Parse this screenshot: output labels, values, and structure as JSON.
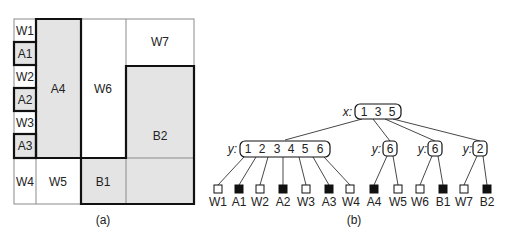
{
  "panel_a": {
    "caption": "(a)",
    "colors": {
      "shaded": "#e4e4e4",
      "white": "#ffffff",
      "thin_line": "#888888",
      "thick_line": "#111111"
    },
    "cells": [
      {
        "id": "W1",
        "label": "W1",
        "shaded": false
      },
      {
        "id": "A1",
        "label": "A1",
        "shaded": true
      },
      {
        "id": "W2",
        "label": "W2",
        "shaded": false
      },
      {
        "id": "A2",
        "label": "A2",
        "shaded": true
      },
      {
        "id": "W3",
        "label": "W3",
        "shaded": false
      },
      {
        "id": "A3",
        "label": "A3",
        "shaded": true
      },
      {
        "id": "A4",
        "label": "A4",
        "shaded": true
      },
      {
        "id": "W6",
        "label": "W6",
        "shaded": false
      },
      {
        "id": "W7",
        "label": "W7",
        "shaded": false
      },
      {
        "id": "B2",
        "label": "B2",
        "shaded": true
      },
      {
        "id": "W4",
        "label": "W4",
        "shaded": false
      },
      {
        "id": "W5",
        "label": "W5",
        "shaded": false
      },
      {
        "id": "B1",
        "label": "B1",
        "shaded": true
      }
    ]
  },
  "panel_b": {
    "caption": "(b)",
    "root": {
      "axis_label": "x:",
      "keys": [
        "1",
        "3",
        "5"
      ]
    },
    "internal_nodes": [
      {
        "axis_label": "y:",
        "keys": [
          "1",
          "2",
          "3",
          "4",
          "5",
          "6"
        ]
      },
      {
        "axis_label": "y:",
        "keys": [
          "6"
        ]
      },
      {
        "axis_label": "y:",
        "keys": [
          "6"
        ]
      },
      {
        "axis_label": "y:",
        "keys": [
          "2"
        ]
      }
    ],
    "leaves": [
      {
        "label": "W1",
        "filled": false
      },
      {
        "label": "A1",
        "filled": true
      },
      {
        "label": "W2",
        "filled": false
      },
      {
        "label": "A2",
        "filled": true
      },
      {
        "label": "W3",
        "filled": false
      },
      {
        "label": "A3",
        "filled": true
      },
      {
        "label": "W4",
        "filled": false
      },
      {
        "label": "A4",
        "filled": true
      },
      {
        "label": "W5",
        "filled": false
      },
      {
        "label": "W6",
        "filled": false
      },
      {
        "label": "B1",
        "filled": true
      },
      {
        "label": "W7",
        "filled": false
      },
      {
        "label": "B2",
        "filled": true
      }
    ]
  }
}
